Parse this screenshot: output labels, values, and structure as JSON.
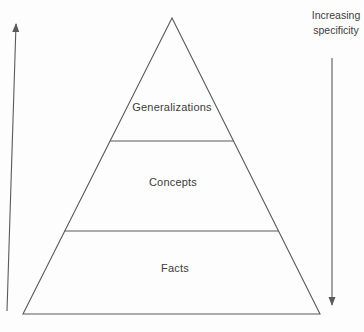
{
  "diagram": {
    "type": "pyramid",
    "levels": [
      {
        "label": "Generalizations"
      },
      {
        "label": "Concepts"
      },
      {
        "label": "Facts"
      }
    ],
    "annotation": {
      "line1": "Increasing",
      "line2": "specificity"
    },
    "arrows": {
      "left": "up-arrow",
      "right": "down-arrow"
    },
    "colors": {
      "line": "#5a5a5a",
      "text": "#3c3c3c",
      "background": "#fdfdfd"
    }
  }
}
